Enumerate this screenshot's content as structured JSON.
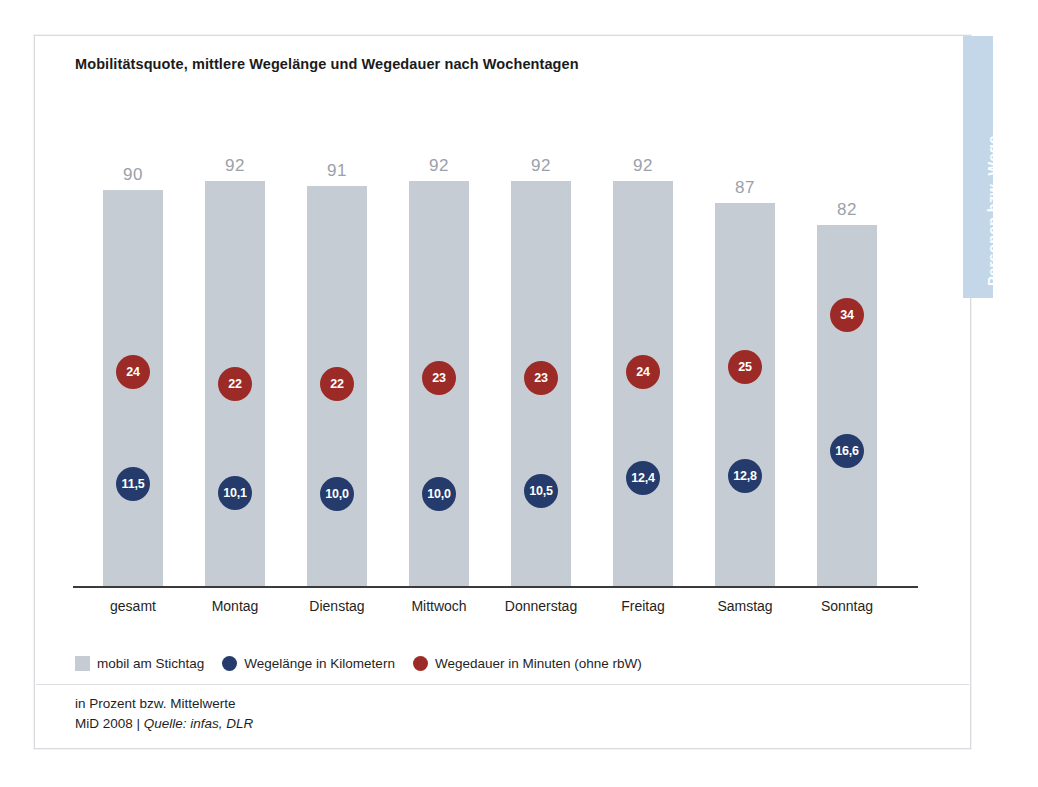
{
  "side_tab": {
    "label": "Personen bzw. Wege",
    "color": "#c3d7e9"
  },
  "chart_data": {
    "type": "bar",
    "title": "Mobilitätsquote, mittlere Wegelänge und Wegedauer nach Wochentagen",
    "xlabel": "",
    "ylabel": "",
    "ylim": [
      0,
      100
    ],
    "grid": false,
    "legend_position": "bottom-left",
    "categories": [
      "gesamt",
      "Montag",
      "Dienstag",
      "Mittwoch",
      "Donnerstag",
      "Freitag",
      "Samstag",
      "Sonntag"
    ],
    "series": [
      {
        "name": "mobil am Stichtag",
        "kind": "bar",
        "unit": "%",
        "color": "#c6ccd4",
        "values": [
          90,
          92,
          91,
          92,
          92,
          92,
          87,
          82
        ],
        "labels": [
          "90",
          "92",
          "91",
          "92",
          "92",
          "92",
          "87",
          "82"
        ]
      },
      {
        "name": "Wegelänge in Kilometern",
        "kind": "marker",
        "unit": "km",
        "color": "#243b6b",
        "values": [
          11.5,
          10.1,
          10.0,
          10.0,
          10.5,
          12.4,
          12.8,
          16.6
        ],
        "labels": [
          "11,5",
          "10,1",
          "10,0",
          "10,0",
          "10,5",
          "12,4",
          "12,8",
          "16,6"
        ]
      },
      {
        "name": "Wegedauer in Minuten (ohne rbW)",
        "kind": "marker",
        "unit": "min",
        "color": "#9c2b27",
        "values": [
          24,
          22,
          22,
          23,
          23,
          24,
          25,
          34
        ],
        "labels": [
          "24",
          "22",
          "22",
          "23",
          "23",
          "24",
          "25",
          "34"
        ]
      }
    ]
  },
  "legend": [
    {
      "label": "mobil am Stichtag",
      "swatch": "square",
      "color": "#c6ccd4"
    },
    {
      "label": "Wegelänge in Kilometern",
      "swatch": "circle",
      "color": "#243b6b"
    },
    {
      "label": "Wegedauer in Minuten (ohne rbW)",
      "swatch": "circle",
      "color": "#9c2b27"
    }
  ],
  "footer": {
    "note": "in Prozent bzw. Mittelwerte",
    "source_prefix": "MiD 2008 | ",
    "source": "Quelle: infas, DLR"
  }
}
